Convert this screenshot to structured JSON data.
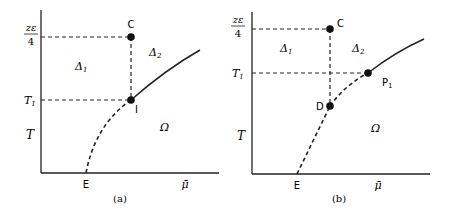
{
  "panels": [
    {
      "id": "a",
      "caption": "(a)",
      "y_axis_label": "T",
      "x_axis_label": "μ̄",
      "y_ticks": {
        "top_num": "zε",
        "top_den": "4",
        "t1": "T",
        "t1_sub": "1"
      },
      "x_tick": "E",
      "points": {
        "c": "C",
        "i": "I"
      },
      "regions": {
        "delta1": "Δ",
        "delta1_sub": "1",
        "delta2": "Δ",
        "delta2_sub": "2",
        "omega": "Ω"
      }
    },
    {
      "id": "b",
      "caption": "(b)",
      "y_axis_label": "T",
      "x_axis_label": "μ̄",
      "y_ticks": {
        "top_num": "zε",
        "top_den": "4",
        "t1": "T",
        "t1_sub": "1"
      },
      "x_tick": "E",
      "points": {
        "c": "C",
        "d": "D",
        "p1": "P",
        "p1_sub": "1"
      },
      "regions": {
        "delta1": "Δ",
        "delta1_sub": "1",
        "delta2": "Δ",
        "delta2_sub": "2",
        "omega": "Ω"
      }
    }
  ]
}
